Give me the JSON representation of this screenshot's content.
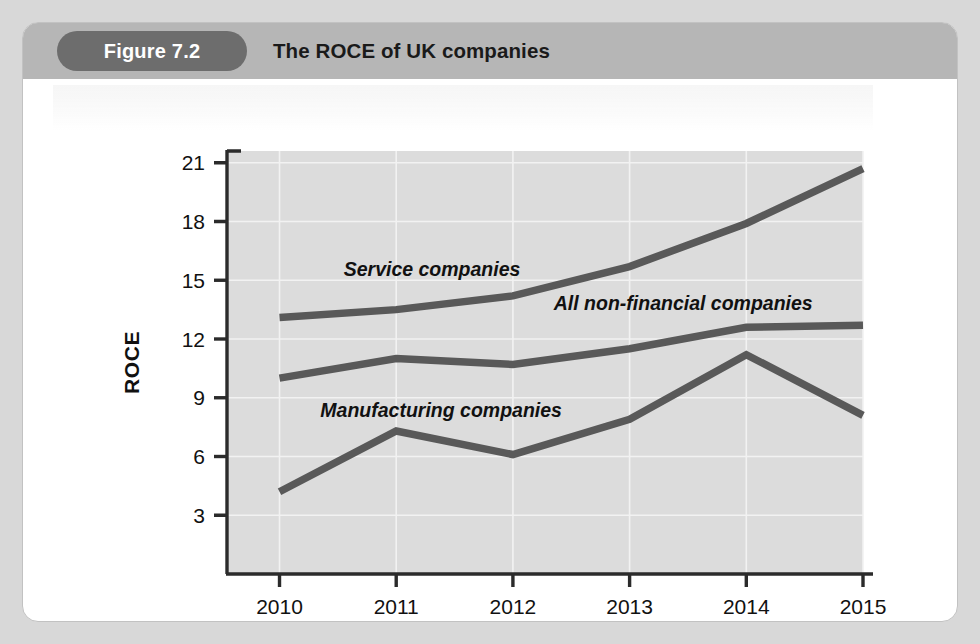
{
  "figure": {
    "badge_label": "Figure 7.2",
    "title": "The ROCE of UK companies"
  },
  "colors": {
    "page_background": "#d8d8d8",
    "card_background": "#ffffff",
    "card_border": "#c2c2c2",
    "header_bar": "#b6b6b6",
    "badge_background": "#6d6d6d",
    "badge_text": "#ffffff",
    "title_text": "#1a1a1a",
    "plot_background": "#dcdcdc",
    "gridline": "#f2f2f2",
    "axis_line": "#2b2b2b",
    "series_line": "#595959"
  },
  "chart_data": {
    "type": "line",
    "title": "The ROCE of UK companies",
    "xlabel": "",
    "ylabel": "ROCE",
    "x": [
      2010,
      2011,
      2012,
      2013,
      2014,
      2015
    ],
    "categories": [
      "2010",
      "2011",
      "2012",
      "2013",
      "2014",
      "2015"
    ],
    "xticklabels": [
      "2010",
      "2011",
      "2012",
      "2013",
      "2014",
      "2015"
    ],
    "yticklabels": [
      "3",
      "6",
      "9",
      "12",
      "15",
      "18",
      "21"
    ],
    "yticks": [
      3,
      6,
      9,
      12,
      15,
      18,
      21
    ],
    "ylim": [
      0,
      21.6
    ],
    "xlim": [
      2009.55,
      2015.0
    ],
    "grid": true,
    "legend": "inline-annotations",
    "series": [
      {
        "name": "Service companies",
        "label": "Service companies",
        "values": [
          13.1,
          13.5,
          14.2,
          15.7,
          17.9,
          20.7
        ],
        "color": "#595959"
      },
      {
        "name": "All non-financial companies",
        "label": "All non-financial companies",
        "values": [
          10.0,
          11.0,
          10.7,
          11.5,
          12.6,
          12.7
        ],
        "color": "#595959"
      },
      {
        "name": "Manufacturing companies",
        "label": "Manufacturing companies",
        "values": [
          4.2,
          7.3,
          6.1,
          7.9,
          11.2,
          8.1
        ],
        "color": "#595959"
      }
    ],
    "annotations": [
      {
        "text": "Service companies",
        "x": 2010.55,
        "y": 15.2
      },
      {
        "text": "All non-financial companies",
        "x": 2012.35,
        "y": 13.5
      },
      {
        "text": "Manufacturing companies",
        "x": 2010.35,
        "y": 8.0
      }
    ]
  }
}
